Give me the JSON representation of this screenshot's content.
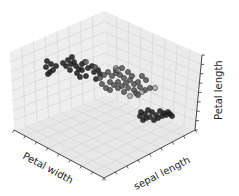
{
  "chart_data": {
    "type": "scatter",
    "projection": "3d",
    "title": "",
    "xlabel": "Petal width",
    "ylabel": "sepal length",
    "zlabel": "Petal length",
    "grid": true,
    "legend": null,
    "colors": {
      "pane": "#ececec",
      "pane_floor": "#e6e6e6",
      "grid": "#d4d4d4",
      "axis": "#333333",
      "class_dark": "#1c1c1c",
      "class_mid": "#555555",
      "class_light": "#8a8a8a"
    },
    "series": [
      {
        "name": "cluster-dark",
        "description": "dark markers, upper-left cluster",
        "points_px": [
          [
            47,
            61
          ],
          [
            51,
            64
          ],
          [
            46,
            67
          ],
          [
            53,
            70
          ],
          [
            50,
            72
          ],
          [
            56,
            66
          ],
          [
            48,
            74
          ],
          [
            63,
            63
          ],
          [
            66,
            66
          ],
          [
            68,
            60
          ],
          [
            71,
            64
          ],
          [
            70,
            70
          ],
          [
            74,
            62
          ],
          [
            72,
            57
          ],
          [
            76,
            66
          ],
          [
            79,
            69
          ],
          [
            82,
            64
          ],
          [
            77,
            73
          ],
          [
            85,
            62
          ],
          [
            82,
            70
          ],
          [
            88,
            68
          ],
          [
            92,
            66
          ],
          [
            94,
            72
          ],
          [
            86,
            76
          ],
          [
            98,
            70
          ],
          [
            100,
            74
          ],
          [
            80,
            77
          ],
          [
            96,
            79
          ]
        ]
      },
      {
        "name": "cluster-mid",
        "description": "grey markers, center cluster",
        "points_px": [
          [
            95,
            67
          ],
          [
            100,
            78
          ],
          [
            104,
            75
          ],
          [
            108,
            72
          ],
          [
            112,
            76
          ],
          [
            116,
            73
          ],
          [
            120,
            75
          ],
          [
            124,
            78
          ],
          [
            110,
            82
          ],
          [
            114,
            85
          ],
          [
            118,
            82
          ],
          [
            122,
            86
          ],
          [
            126,
            83
          ],
          [
            130,
            80
          ],
          [
            134,
            84
          ],
          [
            138,
            82
          ],
          [
            106,
            88
          ],
          [
            102,
            84
          ],
          [
            110,
            90
          ],
          [
            118,
            88
          ],
          [
            128,
            88
          ],
          [
            134,
            90
          ],
          [
            140,
            87
          ],
          [
            145,
            90
          ],
          [
            150,
            88
          ],
          [
            136,
            93
          ],
          [
            124,
            92
          ],
          [
            116,
            70
          ],
          [
            142,
            76
          ],
          [
            146,
            80
          ],
          [
            128,
            72
          ],
          [
            132,
            76
          ],
          [
            122,
            68
          ],
          [
            138,
            95
          ]
        ]
      },
      {
        "name": "cluster-light",
        "description": "light markers",
        "points_px": [
          [
            86,
            62
          ],
          [
            116,
            68
          ],
          [
            118,
            70
          ],
          [
            155,
            88
          ],
          [
            142,
            92
          ],
          [
            130,
            96
          ]
        ]
      },
      {
        "name": "cluster-low",
        "description": "dark markers, lower-right cluster",
        "points_px": [
          [
            141,
            112
          ],
          [
            145,
            114
          ],
          [
            148,
            110
          ],
          [
            152,
            112
          ],
          [
            156,
            115
          ],
          [
            160,
            111
          ],
          [
            164,
            113
          ],
          [
            168,
            112
          ],
          [
            150,
            117
          ],
          [
            158,
            118
          ],
          [
            162,
            116
          ],
          [
            146,
            118
          ],
          [
            154,
            120
          ],
          [
            166,
            115
          ],
          [
            170,
            114
          ],
          [
            143,
            120
          ],
          [
            140,
            116
          ],
          [
            172,
            116
          ]
        ]
      }
    ]
  }
}
